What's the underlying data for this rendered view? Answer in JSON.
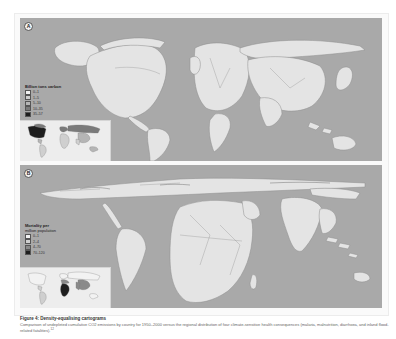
{
  "figure": {
    "title": "Figure 4: Density-equalising cartograms",
    "caption": "Comparison of undepleted cumulative CO2 emissions by country for 1950–2000 versus the regional distribution of four climate-sensitive health consequences (malaria, malnutrition, diarrhoea, and inland flood-related fatalities).",
    "caption_superscript": "12"
  },
  "panels": [
    {
      "label": "A",
      "legend": {
        "title": "Billion tons carbon",
        "items": [
          {
            "label": "0–1",
            "color": "#f2f2f2"
          },
          {
            "label": "1–5",
            "color": "#cfcfcf"
          },
          {
            "label": "5–10",
            "color": "#b5b5b5"
          },
          {
            "label": "10–35",
            "color": "#7a7a7a"
          },
          {
            "label": "35–57",
            "color": "#1e1e1e"
          }
        ]
      },
      "inset_highlight": "United States (darkest)"
    },
    {
      "label": "B",
      "legend": {
        "title_line1": "Mortality per",
        "title_line2": "million population",
        "items": [
          {
            "label": "0–1",
            "color": "#f2f2f2"
          },
          {
            "label": "2–4",
            "color": "#cfcfcf"
          },
          {
            "label": "4–70",
            "color": "#8a8a8a"
          },
          {
            "label": "70–120",
            "color": "#1e1e1e"
          }
        ]
      },
      "inset_highlight": "Sub-Saharan Africa (darkest)"
    }
  ],
  "colors": {
    "ocean": "#a9a9a9",
    "land": "#e4e4e4",
    "border": "#8d8d8d"
  }
}
